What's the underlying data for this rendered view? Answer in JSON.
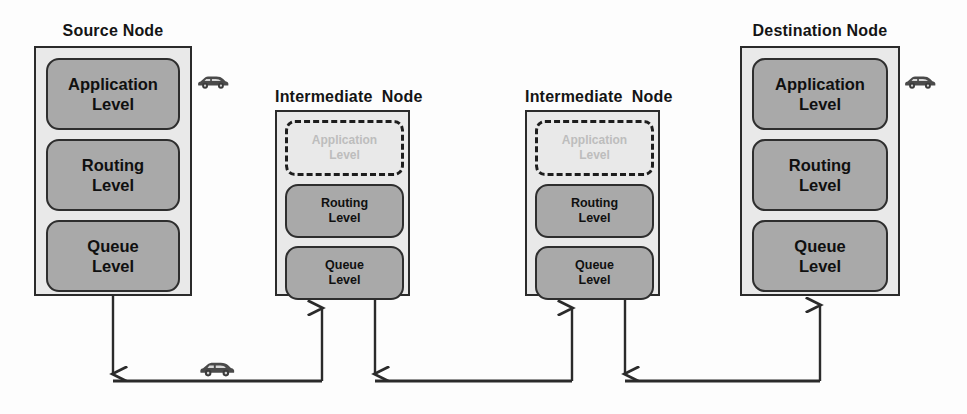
{
  "diagram": {
    "colors": {
      "layer_fill": "#a9a9a9",
      "node_fill": "#e9e9e9",
      "outline": "#2b2b2b",
      "ghost_text": "#bdbdbd",
      "edge": "#2b2b2b"
    },
    "nodes": [
      {
        "id": "source",
        "title": "Source Node",
        "layers": [
          {
            "id": "application",
            "line1": "Application",
            "line2": "Level",
            "ghost": false
          },
          {
            "id": "routing",
            "line1": "Routing",
            "line2": "Level",
            "ghost": false
          },
          {
            "id": "queue",
            "line1": "Queue",
            "line2": "Level",
            "ghost": false
          }
        ]
      },
      {
        "id": "intermediate-1",
        "title": "Intermediate  Node",
        "layers": [
          {
            "id": "application",
            "line1": "Application",
            "line2": "Level",
            "ghost": true
          },
          {
            "id": "routing",
            "line1": "Routing",
            "line2": "Level",
            "ghost": false
          },
          {
            "id": "queue",
            "line1": "Queue",
            "line2": "Level",
            "ghost": false
          }
        ]
      },
      {
        "id": "intermediate-2",
        "title": "Intermediate  Node",
        "layers": [
          {
            "id": "application",
            "line1": "Application",
            "line2": "Level",
            "ghost": true
          },
          {
            "id": "routing",
            "line1": "Routing",
            "line2": "Level",
            "ghost": false
          },
          {
            "id": "queue",
            "line1": "Queue",
            "line2": "Level",
            "ghost": false
          }
        ]
      },
      {
        "id": "destination",
        "title": "Destination Node",
        "layers": [
          {
            "id": "application",
            "line1": "Application",
            "line2": "Level",
            "ghost": false
          },
          {
            "id": "routing",
            "line1": "Routing",
            "line2": "Level",
            "ghost": false
          },
          {
            "id": "queue",
            "line1": "Queue",
            "line2": "Level",
            "ghost": false
          }
        ]
      }
    ],
    "icons": [
      {
        "id": "car-source",
        "name": "car-icon"
      },
      {
        "id": "car-link",
        "name": "car-icon"
      },
      {
        "id": "car-destination",
        "name": "car-icon"
      }
    ],
    "links": [
      {
        "id": "link-source-to-int1",
        "from": "source.queue",
        "to": "intermediate-1.queue"
      },
      {
        "id": "link-int1-to-int2",
        "from": "intermediate-1.queue",
        "to": "intermediate-2.queue"
      },
      {
        "id": "link-int2-to-destination",
        "from": "intermediate-2.queue",
        "to": "destination.queue"
      }
    ]
  }
}
